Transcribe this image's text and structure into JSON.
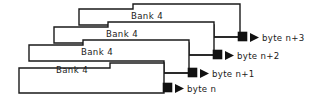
{
  "diagram": {
    "type": "memory-bank-stack",
    "background_color": "#ffffff",
    "line_color": "#1a1a1a",
    "marker_color": "#111111",
    "banks": [
      {
        "id": "bank-top",
        "label": "Bank 4",
        "byte_label": "byte n+3",
        "label_x": 147,
        "label_y": 16,
        "outline": "M 79 9 L 133 9 L 133 4 L 240 4 L 240 37 L 214 37 L 214 25 L 79 25 Z",
        "lead": "M 214 37 L 238 37",
        "marker": {
          "x": 238,
          "y": 32,
          "size": 9
        },
        "arrow": {
          "x": 250,
          "y": 37
        },
        "byte_label_x": 262,
        "byte_label_y": 38
      },
      {
        "id": "bank-second",
        "label": "Bank 4",
        "byte_label": "byte n+2",
        "label_x": 122,
        "label_y": 34,
        "outline": "M 54 27 L 108 27 L 108 22 L 214 22 L 214 55 L 189 55 L 189 43 L 54 43 Z",
        "lead": "M 189 55 L 213 55",
        "marker": {
          "x": 213,
          "y": 50,
          "size": 9
        },
        "arrow": {
          "x": 225,
          "y": 55
        },
        "byte_label_x": 237,
        "byte_label_y": 56
      },
      {
        "id": "bank-third",
        "label": "Bank 4",
        "byte_label": "byte n+1",
        "label_x": 97,
        "label_y": 52,
        "outline": "M 29 45 L 83 45 L 83 40 L 189 40 L 189 73 L 164 73 L 164 61 L 29 61 Z",
        "lead": "M 164 73 L 188 73",
        "marker": {
          "x": 188,
          "y": 68,
          "size": 9
        },
        "arrow": {
          "x": 200,
          "y": 73
        },
        "byte_label_x": 212,
        "byte_label_y": 74
      },
      {
        "id": "bank-bottom",
        "label": "Bank 4",
        "byte_label": "byte n",
        "label_x": 72,
        "label_y": 70,
        "outline": "M 19 68 L 110 68 L 110 63 L 164 63 L 164 93 L 19 93 Z",
        "lead": "M 164 88 L 163 88",
        "marker": {
          "x": 163,
          "y": 83,
          "size": 9
        },
        "arrow": {
          "x": 175,
          "y": 88
        },
        "byte_label_x": 187,
        "byte_label_y": 89
      }
    ]
  }
}
